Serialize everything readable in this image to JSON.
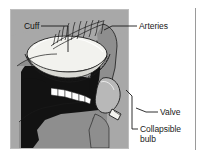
{
  "figure": {
    "type": "anatomical-line-diagram",
    "background_color": "#ffffff",
    "panel_color": "#a8a8a8",
    "ink_color": "#1a1a1a",
    "tissue_color": "#8e8e8e",
    "cavity_color": "#121212",
    "cuff_color": "#f2f2ee",
    "bulb_color": "#b8b8b8",
    "teeth_color": "#ffffff"
  },
  "labels": {
    "cuff": "Cuff",
    "arteries": "Arteries",
    "valve": "Valve",
    "bulb": "Collapsible\nbulb"
  },
  "icons": {
    "leader_line": "leader-line",
    "page_rule": "vertical-rule"
  }
}
